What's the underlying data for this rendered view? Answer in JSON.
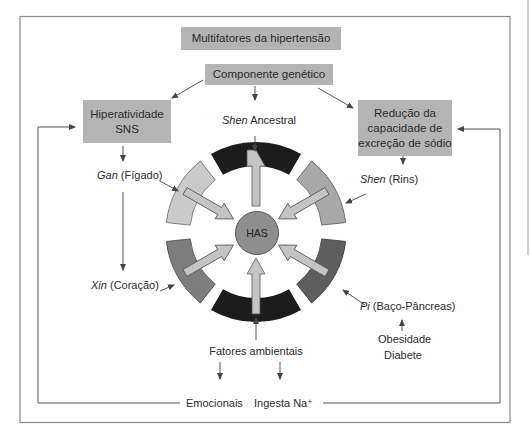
{
  "diagram": {
    "title": "Multifatores da hipertensão",
    "genetic_component": "Componente genético",
    "left_box": {
      "line1": "Hiperatividade",
      "line2": "SNS"
    },
    "right_box": {
      "line1": "Redução da",
      "line2": "capacidade de",
      "line3": "excreção de sódio"
    },
    "center": "HAS",
    "organs": {
      "shen_ancestral": {
        "italic": "Shen",
        "rest": " Ancestral"
      },
      "gan": {
        "italic": "Gan",
        "rest": " (Fígado)"
      },
      "xin": {
        "italic": "Xin",
        "rest": " (Coração)"
      },
      "shen_rins": {
        "italic": "Shen",
        "rest": " (Rins)"
      },
      "pi": {
        "italic": "Pi",
        "rest": " (Baço-Pâncreas)"
      }
    },
    "pi_factors": {
      "line1": "Obesidade",
      "line2": "Diabete"
    },
    "environmental": {
      "label": "Fatores ambientais",
      "emotional": "Emocionais",
      "sodium": "Ingesta Na⁺"
    },
    "ring_segments": [
      {
        "position": "top",
        "color": "#1c1c1c"
      },
      {
        "position": "upper-right",
        "color": "#a9a9a9"
      },
      {
        "position": "lower-right",
        "color": "#5e5e5e"
      },
      {
        "position": "bottom",
        "color": "#1c1c1c"
      },
      {
        "position": "lower-left",
        "color": "#7e7e7e"
      },
      {
        "position": "upper-left",
        "color": "#cacaca"
      }
    ],
    "colors": {
      "box_fill": "#b4b4b4",
      "arrow_fill": "#c4c4c4",
      "line": "#555555",
      "center_fill": "#8e8e8e"
    }
  }
}
